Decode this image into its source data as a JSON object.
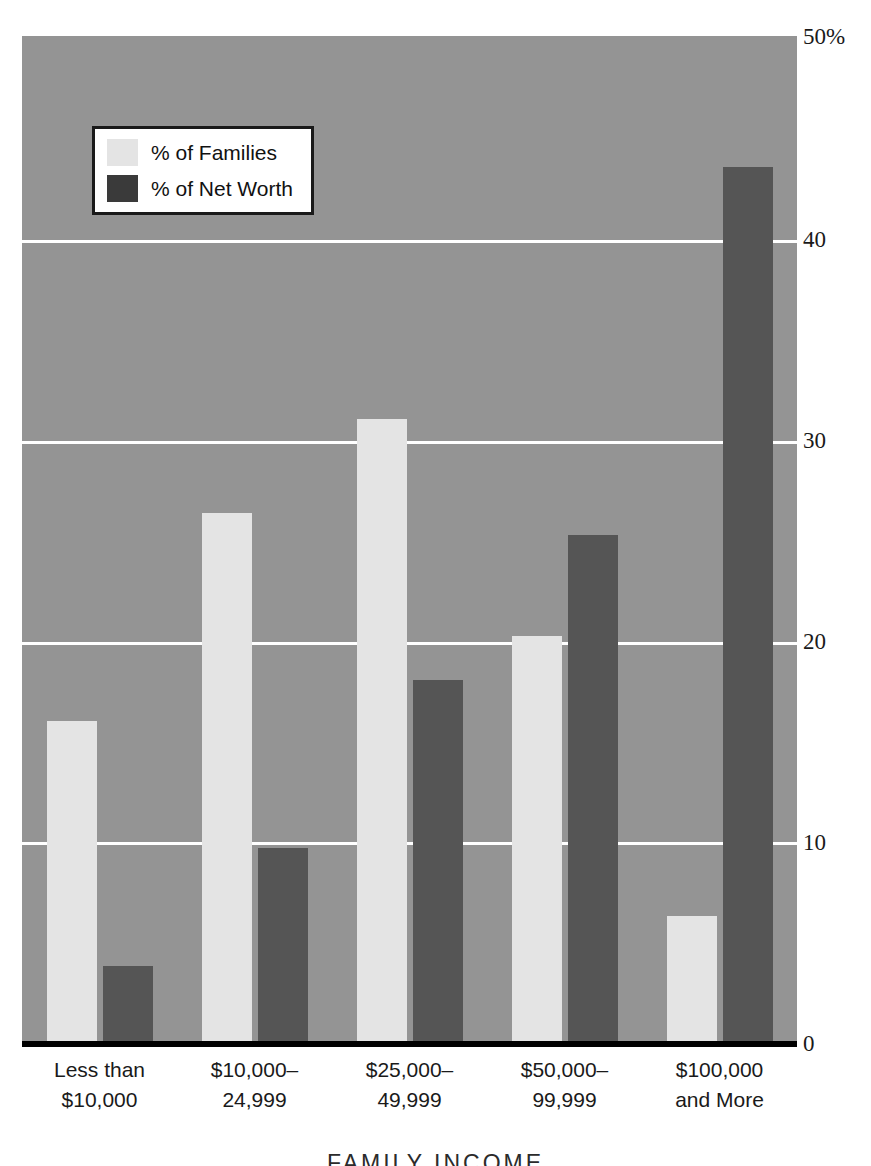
{
  "chart_data": {
    "type": "bar",
    "title": "",
    "xlabel": "FAMILY INCOME",
    "ylabel": "",
    "ylim": [
      0,
      50
    ],
    "yticks": [
      0,
      10,
      20,
      30,
      40,
      50
    ],
    "ytick_labels": [
      "0",
      "10",
      "20",
      "30",
      "40",
      "50%"
    ],
    "grid": true,
    "legend_position": "top-left",
    "categories": [
      "Less than $10,000",
      "$10,000–24,999",
      "$25,000–49,999",
      "$50,000–99,999",
      "$100,000 and More"
    ],
    "series": [
      {
        "name": "% of Families",
        "color": "#e4e4e4",
        "values": [
          16.0,
          26.3,
          31.0,
          20.2,
          6.3
        ]
      },
      {
        "name": "% of Net Worth",
        "color": "#555555",
        "values": [
          3.8,
          9.7,
          18.0,
          25.2,
          43.5
        ]
      }
    ]
  },
  "axes": {
    "y_ticks": [
      {
        "label": "50%",
        "value": 50
      },
      {
        "label": "40",
        "value": 40
      },
      {
        "label": "30",
        "value": 30
      },
      {
        "label": "20",
        "value": 20
      },
      {
        "label": "10",
        "value": 10
      },
      {
        "label": "0",
        "value": 0
      }
    ],
    "x_groups": [
      {
        "line1": "Less than",
        "line2": "$10,000"
      },
      {
        "line1": "$10,000–",
        "line2": "24,999"
      },
      {
        "line1": "$25,000–",
        "line2": "49,999"
      },
      {
        "line1": "$50,000–",
        "line2": "99,999"
      },
      {
        "line1": "$100,000",
        "line2": "and More"
      }
    ],
    "x_axis_title": "FAMILY INCOME"
  },
  "legend": {
    "items": [
      {
        "label": "% of Families",
        "swatch": "families-swatch"
      },
      {
        "label": "% of Net Worth",
        "swatch": "networth-swatch"
      }
    ]
  },
  "colors": {
    "plot_background": "#949494",
    "gridline": "#ffffff",
    "baseline": "#000000",
    "families_bar": "#e4e4e4",
    "networth_bar": "#555555",
    "page_background": "#ffffff"
  }
}
